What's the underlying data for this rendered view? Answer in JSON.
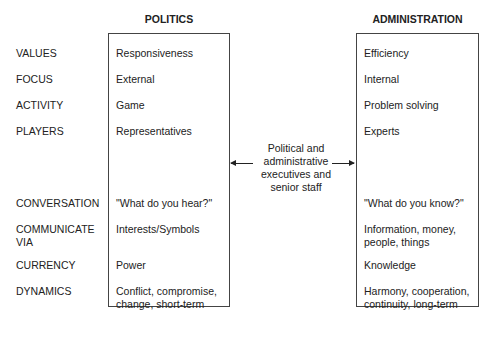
{
  "headers": {
    "politics": "POLITICS",
    "administration": "ADMINISTRATION"
  },
  "rows": [
    {
      "label": "VALUES",
      "politics": "Responsiveness",
      "administration": "Efficiency"
    },
    {
      "label": "FOCUS",
      "politics": "External",
      "administration": "Internal"
    },
    {
      "label": "ACTIVITY",
      "politics": "Game",
      "administration": "Problem solving"
    },
    {
      "label": "PLAYERS",
      "politics": "Representatives",
      "administration": "Experts"
    },
    {
      "label": "CONVERSATION",
      "politics": "\"What do you hear?\"",
      "administration": "\"What do you know?\""
    },
    {
      "label": "COMMUNICATE VIA",
      "politics": "Interests/Symbols",
      "administration": "Information, money, people, things"
    },
    {
      "label": "CURRENCY",
      "politics": "Power",
      "administration": "Knowledge"
    },
    {
      "label": "DYNAMICS",
      "politics": "Conflict, compromise, change, short-term",
      "administration": "Harmony, cooperation, continuity, long-term"
    }
  ],
  "middle": {
    "text": "Political and administrative executives and senior staff",
    "arrows": "bidirectional"
  },
  "caption": "FIGURE 2.1 (partially cut off, illegible)"
}
